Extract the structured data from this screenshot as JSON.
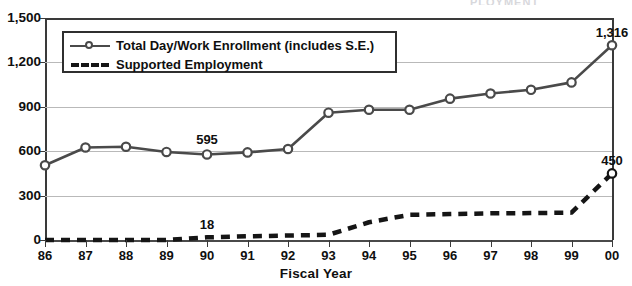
{
  "page": {
    "cutoff_header": "PLOYMENT"
  },
  "chart_data": {
    "type": "line",
    "title": "",
    "xlabel": "Fiscal Year",
    "ylabel": "",
    "ylim": [
      0,
      1500
    ],
    "yticks": [
      "0",
      "300",
      "600",
      "900",
      "1,200",
      "1,500"
    ],
    "ytick_values": [
      0,
      300,
      600,
      900,
      1200,
      1500
    ],
    "grid": true,
    "legend_position": "upper-left-inside",
    "categories": [
      "86",
      "87",
      "88",
      "89",
      "90",
      "91",
      "92",
      "93",
      "94",
      "95",
      "96",
      "97",
      "98",
      "99",
      "00"
    ],
    "series": [
      {
        "name": "Total Day/Work Enrollment (includes S.E.)",
        "style": "solid",
        "marker": "open-circle",
        "color": "#4a4a4a",
        "values": [
          505,
          625,
          630,
          595,
          578,
          592,
          615,
          860,
          880,
          880,
          955,
          990,
          1015,
          1065,
          1316
        ]
      },
      {
        "name": "Supported Employment",
        "style": "dashed",
        "marker": "none",
        "color": "#151515",
        "values": [
          0,
          0,
          0,
          0,
          18,
          25,
          30,
          35,
          120,
          170,
          175,
          180,
          182,
          185,
          450
        ]
      }
    ],
    "annotations": [
      {
        "label": "595",
        "category": "90",
        "series": 0,
        "value": 595,
        "position": "above"
      },
      {
        "label": "18",
        "category": "90",
        "series": 1,
        "value": 18,
        "position": "above"
      },
      {
        "label": "1,316",
        "category": "00",
        "series": 0,
        "value": 1316,
        "position": "above"
      },
      {
        "label": "450",
        "category": "00",
        "series": 1,
        "value": 450,
        "position": "above"
      }
    ]
  }
}
